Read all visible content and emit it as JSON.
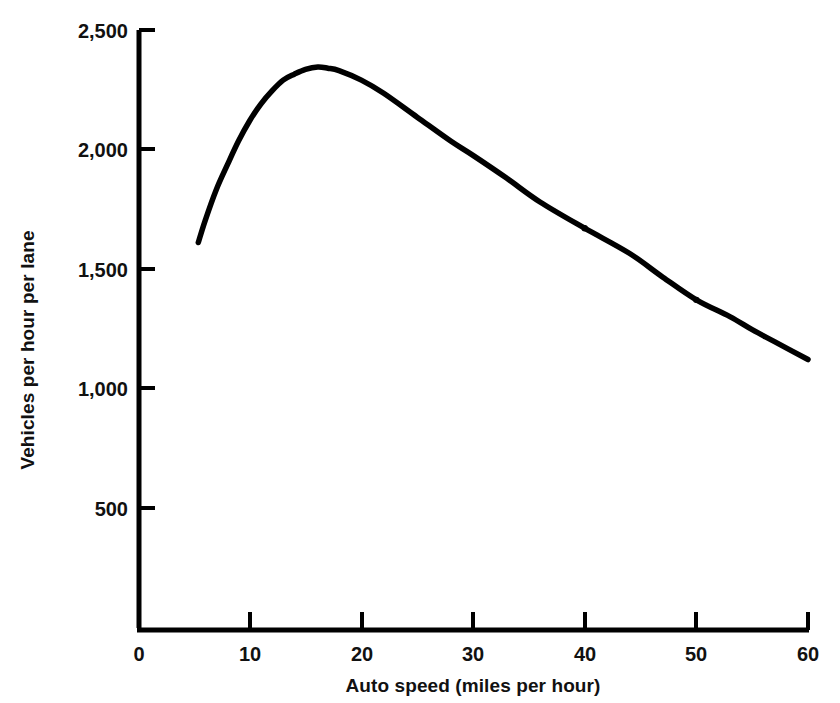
{
  "chart_data": {
    "type": "line",
    "title": "",
    "xlabel": "Auto speed (miles per hour)",
    "ylabel": "Vehicles per hour per lane",
    "xlim": [
      0,
      60
    ],
    "ylim": [
      0,
      2500
    ],
    "grid": false,
    "legend": "none",
    "x_ticks": [
      "0",
      "10",
      "20",
      "30",
      "40",
      "50",
      "60"
    ],
    "x_tick_values": [
      0,
      10,
      20,
      30,
      40,
      50,
      60
    ],
    "y_ticks": [
      "500",
      "1,000",
      "1,500",
      "2,000",
      "2,500"
    ],
    "y_tick_values": [
      500,
      1000,
      1500,
      2000,
      2500
    ],
    "series": [
      {
        "name": "Lane capacity vs auto speed",
        "color": "#000000",
        "x": [
          5.4,
          6,
          7,
          8,
          9,
          10,
          11,
          12,
          13,
          14,
          15,
          16.1,
          17,
          18,
          20,
          22,
          25,
          28,
          30,
          33,
          36,
          40,
          44,
          47,
          50,
          53,
          55,
          57,
          60
        ],
        "values": [
          1610,
          1700,
          1830,
          1935,
          2035,
          2120,
          2190,
          2245,
          2290,
          2315,
          2335,
          2345,
          2340,
          2330,
          2290,
          2235,
          2135,
          2035,
          1975,
          1880,
          1780,
          1670,
          1565,
          1465,
          1370,
          1300,
          1245,
          1195,
          1120
        ]
      }
    ],
    "markers": [
      {
        "label": "marker-40mph",
        "x": 40,
        "y": 1670
      },
      {
        "label": "marker-50mph",
        "x": 50,
        "y": 1370
      }
    ],
    "peak": {
      "x": 16.1,
      "y": 2345
    },
    "axis_geometry": {
      "plot_left_px": 138,
      "plot_right_px": 808,
      "plot_bottom_px": 627,
      "plot_top_px": 30
    }
  },
  "labels": {
    "x_axis_title": "Auto speed (miles per hour)",
    "y_axis_title": "Vehicles per hour per lane",
    "x_tick_0": "0",
    "x_tick_10": "10",
    "x_tick_20": "20",
    "x_tick_30": "30",
    "x_tick_40": "40",
    "x_tick_50": "50",
    "x_tick_60": "60",
    "y_tick_500": "500",
    "y_tick_1000": "1,000",
    "y_tick_1500": "1,500",
    "y_tick_2000": "2,000",
    "y_tick_2500": "2,500"
  },
  "colors": {
    "background": "#ffffff",
    "axis": "#000000",
    "curve": "#000000",
    "text": "#111111"
  }
}
